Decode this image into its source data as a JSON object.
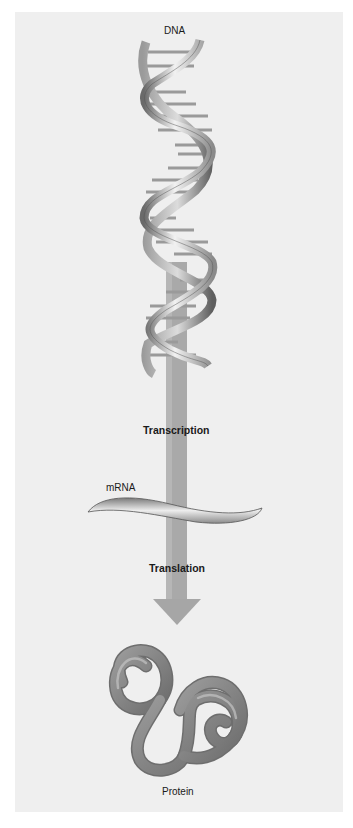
{
  "diagram": {
    "labels": {
      "dna": "DNA",
      "transcription": "Transcription",
      "mrna": "mRNA",
      "translation": "Translation",
      "protein": "Protein"
    },
    "flow": [
      "DNA",
      "Transcription",
      "mRNA",
      "Translation",
      "Protein"
    ],
    "colors": {
      "panel_background": "#efefef",
      "page_background": "#ffffff",
      "arrow": "#a8a8a8",
      "dna_ribbon_light": "#e6e6e6",
      "dna_ribbon_dark": "#6e6e6e",
      "protein": "#8a8a8a",
      "text": "#1a1a1a"
    }
  }
}
